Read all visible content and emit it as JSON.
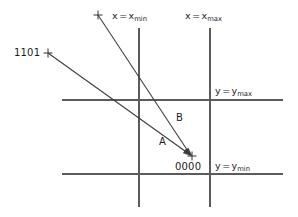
{
  "diagram": {
    "boundaries": [
      {
        "id": "x-min",
        "orientation": "vertical",
        "var": "x",
        "sub": "min",
        "equals": "=",
        "position_px": 139
      },
      {
        "id": "x-max",
        "orientation": "vertical",
        "var": "x",
        "sub": "max",
        "equals": "=",
        "position_px": 210
      },
      {
        "id": "y-max",
        "orientation": "horizontal",
        "var": "y",
        "sub": "max",
        "equals": "=",
        "position_px": 100
      },
      {
        "id": "y-min",
        "orientation": "horizontal",
        "var": "y",
        "sub": "min",
        "equals": "=",
        "position_px": 174
      }
    ],
    "labels": {
      "x_min": {
        "var": "x",
        "equals": "=",
        "name": "x",
        "sub": "min"
      },
      "x_max": {
        "var": "x",
        "equals": "=",
        "name": "x",
        "sub": "max"
      },
      "y_max": {
        "var": "y",
        "equals": "=",
        "name": "y",
        "sub": "max"
      },
      "y_min": {
        "var": "y",
        "equals": "=",
        "name": "y",
        "sub": "min"
      }
    },
    "endpoint_codes": {
      "outside_code": "1101",
      "inside_code": "0000"
    },
    "segments": [
      {
        "id": "A",
        "label": "A",
        "from": {
          "x": 48,
          "y": 53
        },
        "to": {
          "x": 192,
          "y": 156
        },
        "from_code": "1101",
        "to_code": "0000"
      },
      {
        "id": "B",
        "label": "B",
        "from": {
          "x": 98,
          "y": 15
        },
        "to": {
          "x": 192,
          "y": 156
        },
        "from_code": "",
        "to_code": "0000"
      }
    ],
    "markers": [
      {
        "id": "marker-top",
        "x": 98,
        "y": 15,
        "glyph": "cross"
      },
      {
        "id": "marker-1101",
        "x": 48,
        "y": 53,
        "glyph": "cross"
      },
      {
        "id": "marker-0000",
        "x": 192,
        "y": 156,
        "glyph": "cross"
      }
    ],
    "colors": {
      "background": "#ffffff",
      "boundary_line": "#5b5b5b",
      "ray_line": "#3b3b3b",
      "text": "#1d1d1d"
    }
  }
}
